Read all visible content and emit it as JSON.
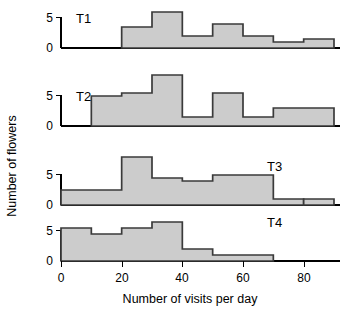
{
  "chart_data": {
    "type": "bar",
    "title": "",
    "subtitle": "",
    "xlabel": "Number of visits per day",
    "ylabel": "Number of flowers",
    "grid": false,
    "legend": null,
    "xlim": [
      0,
      90
    ],
    "ylim": [
      0,
      9
    ],
    "xticks": [
      0,
      20,
      40,
      60,
      80
    ],
    "xtick_labels": [
      "0",
      "20",
      "40",
      "60",
      "80"
    ],
    "yticks": [
      0,
      5
    ],
    "ytick_labels": [
      "0",
      "5"
    ],
    "bin_width": 10,
    "panels": [
      {
        "label": "T1",
        "bin_edges": [
          20,
          30,
          40,
          50,
          60,
          70,
          80,
          90
        ],
        "values": [
          3.5,
          6,
          2,
          4,
          2,
          1,
          1.5
        ],
        "note": "histogram starts at 20 visits"
      },
      {
        "label": "T2",
        "bin_edges": [
          10,
          20,
          30,
          40,
          50,
          60,
          70,
          80,
          90
        ],
        "values": [
          5,
          5.5,
          8.5,
          1.5,
          5.5,
          1.5,
          3,
          3
        ],
        "note": "tallest bar is the 30-40 bin"
      },
      {
        "label": "T3",
        "bin_edges": [
          0,
          10,
          20,
          30,
          40,
          50,
          60,
          70,
          80,
          90
        ],
        "values": [
          2.5,
          2.5,
          8,
          4.5,
          4,
          5,
          5,
          1,
          0
        ],
        "note": "separate short bar at the 80-90 bin, gap at 70-80"
      },
      {
        "label": "T4",
        "bin_edges": [
          0,
          10,
          20,
          30,
          40,
          50,
          60,
          70,
          80,
          90
        ],
        "values": [
          5.5,
          4.5,
          5.5,
          6.5,
          2,
          1,
          1,
          0,
          0
        ],
        "note": "histogram ends at 70 visits"
      }
    ],
    "extra_bar_T3": {
      "bin": [
        80,
        90
      ],
      "value": 1
    },
    "colors": {
      "bar_fill": "#cccccc",
      "bar_edge": "#3a3a3a",
      "axis": "#000000",
      "background": "#ffffff"
    }
  },
  "axis": {
    "x_title": "Number of visits per day",
    "y_title": "Number of flowers",
    "x_tick_labels": [
      "0",
      "20",
      "40",
      "60",
      "80"
    ],
    "y_tick_labels": [
      "0",
      "5"
    ]
  },
  "panel_labels": {
    "t1": "T1",
    "t2": "T2",
    "t3": "T3",
    "t4": "T4"
  }
}
